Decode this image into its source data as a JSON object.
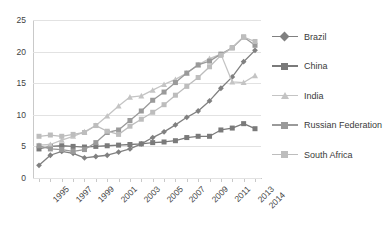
{
  "chart_data": {
    "type": "line",
    "title": "",
    "xlabel": "",
    "ylabel": "",
    "ylim": [
      0,
      25
    ],
    "yticks": [
      0,
      5,
      10,
      15,
      20,
      25
    ],
    "grid": true,
    "legend_position": "right",
    "x": [
      1995,
      1996,
      1997,
      1998,
      1999,
      2000,
      2001,
      2002,
      2003,
      2004,
      2005,
      2006,
      2007,
      2008,
      2009,
      2010,
      2011,
      2012,
      2013,
      2014
    ],
    "xtick_labels": [
      "1995",
      "1997",
      "1999",
      "2001",
      "2003",
      "2005",
      "2007",
      "2009",
      "2011",
      "2013",
      "2014"
    ],
    "series": [
      {
        "name": "Brazil",
        "marker": "diamond",
        "color": "#808080",
        "values": [
          2.0,
          3.6,
          4.2,
          3.9,
          3.2,
          3.4,
          3.6,
          4.1,
          4.6,
          5.4,
          6.4,
          7.3,
          8.4,
          9.6,
          10.6,
          12.2,
          14.2,
          16.0,
          18.4,
          20.2
        ]
      },
      {
        "name": "China",
        "marker": "square",
        "color": "#7a7a7a",
        "values": [
          4.6,
          5.0,
          5.1,
          5.0,
          4.9,
          5.0,
          5.1,
          5.2,
          5.3,
          5.4,
          5.6,
          5.7,
          5.9,
          6.4,
          6.6,
          6.6,
          7.6,
          7.9,
          8.6,
          7.8
        ]
      },
      {
        "name": "India",
        "marker": "triangle",
        "color": "#c4c4c4",
        "values": [
          5.2,
          5.3,
          6.0,
          6.6,
          7.3,
          8.3,
          9.8,
          11.4,
          12.8,
          13.0,
          13.9,
          14.8,
          15.6,
          16.6,
          17.9,
          18.9,
          19.6,
          15.2,
          15.1,
          16.2
        ]
      },
      {
        "name": "Russian Federation",
        "marker": "square",
        "color": "#9a9a9a",
        "values": [
          5.1,
          4.6,
          4.5,
          4.2,
          4.5,
          5.6,
          7.2,
          7.6,
          9.1,
          10.6,
          12.3,
          13.6,
          15.1,
          16.6,
          17.9,
          18.5,
          19.6,
          20.6,
          22.3,
          21.0
        ]
      },
      {
        "name": "South Africa",
        "marker": "square",
        "color": "#bdbdbd",
        "values": [
          6.6,
          6.8,
          6.6,
          6.9,
          7.2,
          8.3,
          7.4,
          6.9,
          8.2,
          9.3,
          10.4,
          11.6,
          13.1,
          14.5,
          15.9,
          17.6,
          19.4,
          20.6,
          22.3,
          21.6
        ]
      }
    ]
  },
  "legend": {
    "items": [
      {
        "label": "Brazil"
      },
      {
        "label": "China"
      },
      {
        "label": "India"
      },
      {
        "label": "Russian Federation"
      },
      {
        "label": "South Africa"
      }
    ]
  }
}
